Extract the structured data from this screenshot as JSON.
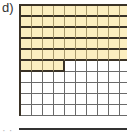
{
  "label": "d)",
  "grid": {
    "rows": 10,
    "cols": 10,
    "filled_cells": 54,
    "filled_full_rows": 5,
    "filled_partial_row_cells": 4,
    "fill_color": "#fbeec0",
    "line_color": "#3a3226"
  },
  "next_label": "e)"
}
